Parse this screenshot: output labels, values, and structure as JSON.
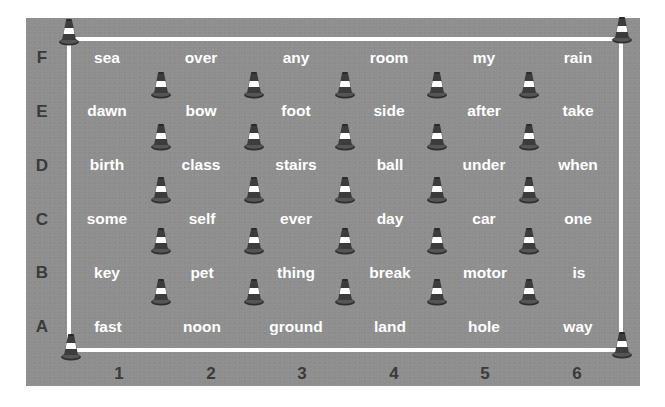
{
  "diagram": {
    "type": "grid-field-with-cones",
    "row_labels": [
      "F",
      "E",
      "D",
      "C",
      "B",
      "A"
    ],
    "column_labels": [
      "1",
      "2",
      "3",
      "4",
      "5",
      "6"
    ],
    "grid": {
      "F": [
        "sea",
        "over",
        "any",
        "room",
        "my",
        "rain"
      ],
      "E": [
        "dawn",
        "bow",
        "foot",
        "side",
        "after",
        "take"
      ],
      "D": [
        "birth",
        "class",
        "stairs",
        "ball",
        "under",
        "when"
      ],
      "C": [
        "some",
        "self",
        "ever",
        "day",
        "car",
        "one"
      ],
      "B": [
        "key",
        "pet",
        "thing",
        "break",
        "motor",
        "is"
      ],
      "A": [
        "fast",
        "noon",
        "ground",
        "land",
        "hole",
        "way"
      ]
    },
    "rows": [
      {
        "label": "F",
        "words": [
          "sea",
          "over",
          "any",
          "room",
          "my",
          "rain"
        ]
      },
      {
        "label": "E",
        "words": [
          "dawn",
          "bow",
          "foot",
          "side",
          "after",
          "take"
        ]
      },
      {
        "label": "D",
        "words": [
          "birth",
          "class",
          "stairs",
          "ball",
          "under",
          "when"
        ]
      },
      {
        "label": "C",
        "words": [
          "some",
          "self",
          "ever",
          "day",
          "car",
          "one"
        ]
      },
      {
        "label": "B",
        "words": [
          "key",
          "pet",
          "thing",
          "break",
          "motor",
          "is"
        ]
      },
      {
        "label": "A",
        "words": [
          "fast",
          "noon",
          "ground",
          "land",
          "hole",
          "way"
        ]
      }
    ],
    "cone_icon": "traffic-cone-icon",
    "corner_cones": 4,
    "interior_cone_rows": 5,
    "interior_cones_per_row": 5,
    "colors": {
      "field": "#8f8f8f",
      "boundary_line": "#ffffff",
      "word_text": "#ffffff",
      "label_text": "#3a3a3a",
      "cone_dark": "#3c3c3c",
      "cone_band": "#ffffff"
    }
  }
}
